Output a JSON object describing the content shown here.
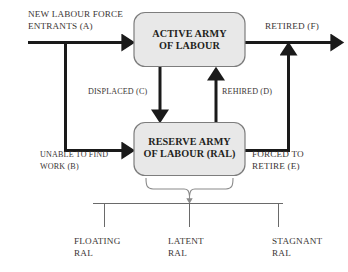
{
  "diagram": {
    "nodes": {
      "active_army": {
        "line1": "ACTIVE ARMY",
        "line2": "OF LABOUR",
        "fill": "#e8e8e8",
        "stroke": "#7d7d7d"
      },
      "reserve_army": {
        "line1": "RESERVE ARMY",
        "line2": "OF LABOUR (RAL)",
        "fill": "#e8e8e8",
        "stroke": "#7d7d7d"
      }
    },
    "flows": {
      "entrants": {
        "line1": "NEW LABOUR FORCE",
        "line2": "ENTRANTS (A)",
        "key": "A"
      },
      "retired": {
        "line1": "RETIRED (F)",
        "key": "F"
      },
      "displaced": {
        "line1": "DISPLACED (C)",
        "key": "C"
      },
      "rehired": {
        "line1": "REHIRED (D)",
        "key": "D"
      },
      "unable_to_find_work": {
        "line1": "UNABLE TO FIND",
        "line2": "WORK (B)",
        "key": "B"
      },
      "forced_to_retire": {
        "line1": "FORCED TO",
        "line2": "RETIRE (E)",
        "key": "E"
      }
    },
    "categories": [
      {
        "line1": "FLOATING",
        "line2": "RAL"
      },
      {
        "line1": "LATENT",
        "line2": "RAL"
      },
      {
        "line1": "STAGNANT",
        "line2": "RAL"
      }
    ],
    "colors": {
      "arrow": "#1a1a1a",
      "box_fill": "#e8e8e8",
      "box_stroke": "#7d7d7d",
      "thin_line": "#6a6a6a",
      "brace": "#8a8a8a",
      "text": "#231f20",
      "label_text": "#3b3634",
      "background": "#ffffff"
    }
  }
}
